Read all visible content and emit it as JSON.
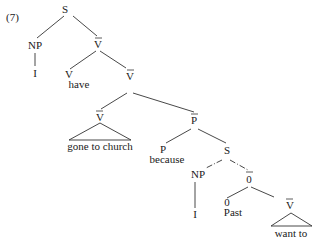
{
  "example_number": "(7)",
  "nodes": {
    "S_root": "S",
    "NP_subj": "NP",
    "I_subj": "I",
    "Vbar_1": "V",
    "V_head": "V",
    "have": "have",
    "Vbar_2": "V",
    "Vbar_3": "V",
    "gone_to_church": "gone to church",
    "Pbar": "P",
    "P_head": "P",
    "because": "because",
    "S_embedded": "S",
    "NP_emb": "NP",
    "I_emb": "I",
    "Obar": "0",
    "O_head": "0",
    "Past": "Past",
    "Vbar_4": "V",
    "want_to": "want to"
  }
}
